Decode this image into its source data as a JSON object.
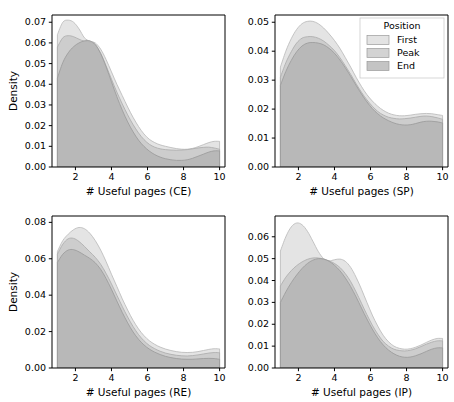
{
  "figure": {
    "width": 454,
    "height": 402,
    "background": "#ffffff"
  },
  "legend": {
    "title": "Position",
    "entries": [
      {
        "label": "First",
        "color": "#d9d9d9",
        "opacity": 0.75
      },
      {
        "label": "Peak",
        "color": "#c4c4c4",
        "opacity": 0.75
      },
      {
        "label": "End",
        "color": "#b0b0b0",
        "opacity": 0.75
      }
    ],
    "panel": "SP",
    "position": "upper-right"
  },
  "chart_data": [
    {
      "type": "area",
      "subplot": "CE",
      "panel_index": 0,
      "title": "",
      "xlabel": "# Useful pages (CE)",
      "ylabel": "Density",
      "xlim": [
        0.7,
        10.3
      ],
      "ylim": [
        0.0,
        0.0735
      ],
      "xticks": [
        2,
        4,
        6,
        8,
        10
      ],
      "yticks": [
        0.0,
        0.01,
        0.02,
        0.03,
        0.04,
        0.05,
        0.06,
        0.07
      ],
      "ytick_labels": [
        "0.00",
        "0.01",
        "0.02",
        "0.03",
        "0.04",
        "0.05",
        "0.06",
        "0.07"
      ],
      "grid": false,
      "x": [
        1.0,
        1.3,
        1.6,
        1.9,
        2.2,
        2.5,
        2.8,
        3.1,
        3.4,
        3.7,
        4.0,
        4.3,
        4.6,
        4.9,
        5.2,
        5.5,
        5.8,
        6.1,
        6.4,
        6.7,
        7.0,
        7.3,
        7.6,
        7.9,
        8.2,
        8.5,
        8.8,
        9.1,
        9.4,
        9.7,
        10.0
      ],
      "series": [
        {
          "name": "First",
          "values": [
            0.064,
            0.07,
            0.071,
            0.07,
            0.0668,
            0.0625,
            0.0608,
            0.06,
            0.057,
            0.052,
            0.046,
            0.04,
            0.0345,
            0.029,
            0.024,
            0.0196,
            0.016,
            0.0134,
            0.0118,
            0.0107,
            0.01,
            0.0094,
            0.0089,
            0.0086,
            0.0086,
            0.009,
            0.0098,
            0.0108,
            0.0118,
            0.0124,
            0.0124
          ]
        },
        {
          "name": "Peak",
          "values": [
            0.058,
            0.0625,
            0.0635,
            0.063,
            0.0618,
            0.0608,
            0.0605,
            0.0592,
            0.055,
            0.049,
            0.0425,
            0.0362,
            0.0305,
            0.0252,
            0.0205,
            0.0165,
            0.0133,
            0.011,
            0.0096,
            0.0088,
            0.0084,
            0.0082,
            0.0081,
            0.0082,
            0.0084,
            0.0088,
            0.0092,
            0.0095,
            0.0096,
            0.0092,
            0.0086
          ]
        },
        {
          "name": "End",
          "values": [
            0.043,
            0.0505,
            0.0552,
            0.0582,
            0.06,
            0.061,
            0.061,
            0.0592,
            0.0548,
            0.0485,
            0.0412,
            0.034,
            0.0275,
            0.0218,
            0.017,
            0.013,
            0.01,
            0.0077,
            0.006,
            0.0048,
            0.004,
            0.0035,
            0.0032,
            0.0032,
            0.0035,
            0.0042,
            0.0052,
            0.0062,
            0.0072,
            0.0078,
            0.0078
          ]
        }
      ]
    },
    {
      "type": "area",
      "subplot": "SP",
      "panel_index": 1,
      "title": "",
      "xlabel": "# Useful pages (SP)",
      "ylabel": "",
      "xlim": [
        0.7,
        10.3
      ],
      "ylim": [
        0.0,
        0.0525
      ],
      "xticks": [
        2,
        4,
        6,
        8,
        10
      ],
      "yticks": [
        0.0,
        0.01,
        0.02,
        0.03,
        0.04,
        0.05
      ],
      "ytick_labels": [
        "0.00",
        "0.01",
        "0.02",
        "0.03",
        "0.04",
        "0.05"
      ],
      "grid": false,
      "x": [
        1.0,
        1.3,
        1.6,
        1.9,
        2.2,
        2.5,
        2.8,
        3.1,
        3.4,
        3.7,
        4.0,
        4.3,
        4.6,
        4.9,
        5.2,
        5.5,
        5.8,
        6.1,
        6.4,
        6.7,
        7.0,
        7.3,
        7.6,
        7.9,
        8.2,
        8.5,
        8.8,
        9.1,
        9.4,
        9.7,
        10.0
      ],
      "series": [
        {
          "name": "First",
          "values": [
            0.0345,
            0.04,
            0.0443,
            0.0475,
            0.0495,
            0.0503,
            0.0503,
            0.0495,
            0.048,
            0.046,
            0.0437,
            0.041,
            0.0378,
            0.0345,
            0.031,
            0.0278,
            0.025,
            0.0228,
            0.021,
            0.0196,
            0.0186,
            0.018,
            0.0177,
            0.0177,
            0.0179,
            0.0182,
            0.0184,
            0.0185,
            0.0184,
            0.0181,
            0.0178
          ]
        },
        {
          "name": "Peak",
          "values": [
            0.031,
            0.036,
            0.0398,
            0.0428,
            0.0445,
            0.045,
            0.045,
            0.0445,
            0.0435,
            0.042,
            0.0402,
            0.0378,
            0.035,
            0.032,
            0.0288,
            0.0258,
            0.0232,
            0.021,
            0.0192,
            0.018,
            0.0172,
            0.0168,
            0.0166,
            0.0167,
            0.0169,
            0.0172,
            0.0175,
            0.0176,
            0.0174,
            0.017,
            0.0165
          ]
        },
        {
          "name": "End",
          "values": [
            0.0282,
            0.033,
            0.0368,
            0.0398,
            0.0418,
            0.0428,
            0.043,
            0.0428,
            0.0422,
            0.041,
            0.0393,
            0.037,
            0.0343,
            0.0313,
            0.0282,
            0.0252,
            0.0225,
            0.0202,
            0.0184,
            0.017,
            0.016,
            0.0152,
            0.0147,
            0.0145,
            0.0146,
            0.015,
            0.0155,
            0.0158,
            0.0158,
            0.0156,
            0.0152
          ]
        }
      ]
    },
    {
      "type": "area",
      "subplot": "RE",
      "panel_index": 2,
      "title": "",
      "xlabel": "# Useful pages (RE)",
      "ylabel": "Density",
      "xlim": [
        0.7,
        10.3
      ],
      "ylim": [
        0.0,
        0.0835
      ],
      "xticks": [
        2,
        4,
        6,
        8,
        10
      ],
      "yticks": [
        0.0,
        0.02,
        0.04,
        0.06,
        0.08
      ],
      "ytick_labels": [
        "0.00",
        "0.02",
        "0.04",
        "0.06",
        "0.08"
      ],
      "grid": false,
      "x": [
        1.0,
        1.3,
        1.6,
        1.9,
        2.2,
        2.5,
        2.8,
        3.1,
        3.4,
        3.7,
        4.0,
        4.3,
        4.6,
        4.9,
        5.2,
        5.5,
        5.8,
        6.1,
        6.4,
        6.7,
        7.0,
        7.3,
        7.6,
        7.9,
        8.2,
        8.5,
        8.8,
        9.1,
        9.4,
        9.7,
        10.0
      ],
      "series": [
        {
          "name": "First",
          "values": [
            0.064,
            0.07,
            0.0735,
            0.076,
            0.0772,
            0.0765,
            0.074,
            0.07,
            0.0648,
            0.0585,
            0.0515,
            0.0448,
            0.038,
            0.0318,
            0.0262,
            0.0215,
            0.0178,
            0.015,
            0.013,
            0.0115,
            0.0104,
            0.0096,
            0.009,
            0.0086,
            0.0085,
            0.0086,
            0.009,
            0.0096,
            0.0102,
            0.0106,
            0.0105
          ]
        },
        {
          "name": "Peak",
          "values": [
            0.0625,
            0.068,
            0.071,
            0.0712,
            0.0695,
            0.0668,
            0.0638,
            0.0608,
            0.057,
            0.052,
            0.0462,
            0.04,
            0.0338,
            0.028,
            0.0228,
            0.0184,
            0.015,
            0.0124,
            0.0106,
            0.0092,
            0.0082,
            0.0075,
            0.007,
            0.0067,
            0.0066,
            0.0068,
            0.0072,
            0.0077,
            0.0082,
            0.0085,
            0.0084
          ]
        },
        {
          "name": "End",
          "values": [
            0.058,
            0.0625,
            0.0648,
            0.065,
            0.0638,
            0.062,
            0.0602,
            0.0578,
            0.0542,
            0.0492,
            0.0432,
            0.0368,
            0.0305,
            0.0248,
            0.0198,
            0.0158,
            0.0127,
            0.0104,
            0.0087,
            0.0074,
            0.0064,
            0.0057,
            0.0052,
            0.0049,
            0.0048,
            0.0048,
            0.005,
            0.0052,
            0.0053,
            0.0052,
            0.0048
          ]
        }
      ]
    },
    {
      "type": "area",
      "subplot": "IP",
      "panel_index": 3,
      "title": "",
      "xlabel": "# Useful pages (IP)",
      "ylabel": "",
      "xlim": [
        0.7,
        10.3
      ],
      "ylim": [
        0.0,
        0.0695
      ],
      "xticks": [
        2,
        4,
        6,
        8,
        10
      ],
      "yticks": [
        0.0,
        0.01,
        0.02,
        0.03,
        0.04,
        0.05,
        0.06
      ],
      "ytick_labels": [
        "0.00",
        "0.01",
        "0.02",
        "0.03",
        "0.04",
        "0.05",
        "0.06"
      ],
      "grid": false,
      "x": [
        1.0,
        1.3,
        1.6,
        1.9,
        2.2,
        2.5,
        2.8,
        3.1,
        3.4,
        3.7,
        4.0,
        4.3,
        4.6,
        4.9,
        5.2,
        5.5,
        5.8,
        6.1,
        6.4,
        6.7,
        7.0,
        7.3,
        7.6,
        7.9,
        8.2,
        8.5,
        8.8,
        9.1,
        9.4,
        9.7,
        10.0
      ],
      "series": [
        {
          "name": "First",
          "values": [
            0.0535,
            0.06,
            0.0645,
            0.0663,
            0.0655,
            0.0625,
            0.058,
            0.0533,
            0.05,
            0.049,
            0.0495,
            0.0498,
            0.0488,
            0.046,
            0.0415,
            0.036,
            0.03,
            0.0242,
            0.0192,
            0.015,
            0.012,
            0.01,
            0.009,
            0.0086,
            0.0088,
            0.0095,
            0.0105,
            0.0117,
            0.0128,
            0.0135,
            0.0135
          ]
        },
        {
          "name": "Peak",
          "values": [
            0.0375,
            0.0415,
            0.0445,
            0.0468,
            0.0485,
            0.0497,
            0.0503,
            0.0503,
            0.0498,
            0.049,
            0.0478,
            0.046,
            0.0432,
            0.0395,
            0.0348,
            0.0296,
            0.0244,
            0.0196,
            0.0155,
            0.0122,
            0.01,
            0.0086,
            0.008,
            0.0078,
            0.0081,
            0.0088,
            0.0098,
            0.0109,
            0.0118,
            0.0124,
            0.0124
          ]
        },
        {
          "name": "End",
          "values": [
            0.03,
            0.0348,
            0.039,
            0.0425,
            0.0455,
            0.0478,
            0.0493,
            0.05,
            0.0498,
            0.0488,
            0.047,
            0.0445,
            0.0412,
            0.0372,
            0.0325,
            0.0274,
            0.0224,
            0.0178,
            0.0138,
            0.0106,
            0.0082,
            0.0065,
            0.0054,
            0.0049,
            0.005,
            0.0056,
            0.0065,
            0.0076,
            0.0086,
            0.0092,
            0.0092
          ]
        }
      ]
    }
  ]
}
